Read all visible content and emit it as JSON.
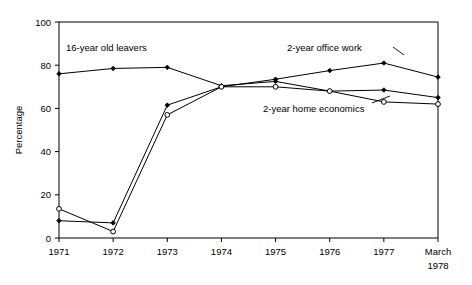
{
  "chart": {
    "type": "line",
    "title": "",
    "xlabel": "",
    "ylabel": "Percentage"
  },
  "axes": {
    "y_label": "Percentage",
    "y_ticks": [
      "0",
      "20",
      "40",
      "60",
      "80",
      "100"
    ],
    "y_min": 0,
    "y_max": 100,
    "x_ticks": [
      "1971",
      "1972",
      "1973",
      "1974",
      "1975",
      "1976",
      "1977",
      "March"
    ],
    "x_last_second_line": "1978"
  },
  "annotations": [
    {
      "name": "leavers-label",
      "text": "16-year old leavers",
      "x": 66,
      "y": 51
    },
    {
      "name": "office-label",
      "text": "2-year office work",
      "x": 287,
      "y": 51
    },
    {
      "name": "home-economics-label",
      "text": "2-year home economics",
      "x": 263,
      "y": 112
    }
  ],
  "chart_data": {
    "type": "line",
    "title": "",
    "xlabel": "",
    "ylabel": "Percentage",
    "ylim": [
      0,
      100
    ],
    "grid": false,
    "legend": "inline-annotations",
    "categories": [
      "1971",
      "1972",
      "1973",
      "1974",
      "1975",
      "1976",
      "1977",
      "March 1978"
    ],
    "series": [
      {
        "name": "16-year old leavers",
        "marker": "diamond",
        "values": [
          76,
          78.5,
          79,
          70.5,
          72.5,
          68,
          68.5,
          65
        ]
      },
      {
        "name": "2-year office work",
        "marker": "diamond",
        "values": [
          8,
          7,
          61.5,
          70,
          73.5,
          77.5,
          81,
          74.5
        ]
      },
      {
        "name": "2-year home economics",
        "marker": "open-circle",
        "values": [
          13.5,
          3,
          57,
          70,
          70,
          68,
          63,
          62
        ]
      }
    ]
  },
  "colors": {
    "line": "#000000",
    "axis": "#000000",
    "background": "#ffffff"
  }
}
